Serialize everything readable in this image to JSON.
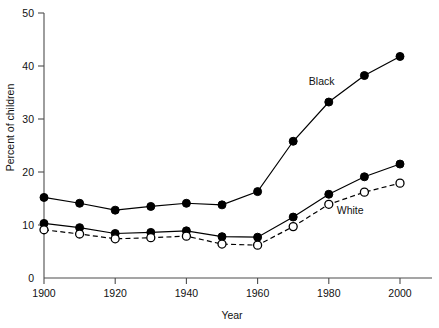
{
  "chart_data": {
    "type": "line",
    "title": "",
    "xlabel": "Year",
    "ylabel": "Percent of children",
    "xlim": [
      1895,
      2005
    ],
    "ylim": [
      0,
      50
    ],
    "xticks": [
      1900,
      1920,
      1940,
      1960,
      1980,
      2000
    ],
    "xtick_labels": [
      "1900",
      "1920",
      "1940",
      "1960",
      "1980",
      "2000"
    ],
    "yticks": [
      0,
      10,
      20,
      30,
      40,
      50
    ],
    "ytick_labels": [
      "0",
      "10",
      "20",
      "30",
      "40",
      "50"
    ],
    "grid": false,
    "legend": "inline-annotations",
    "x": [
      1900,
      1910,
      1920,
      1930,
      1940,
      1950,
      1960,
      1970,
      1980,
      1990,
      2000
    ],
    "series": [
      {
        "name": "Black",
        "label": "Black",
        "marker": "filled-circle",
        "linestyle": "solid",
        "color": "#000000",
        "values": [
          15.2,
          14.1,
          12.8,
          13.5,
          14.1,
          13.8,
          16.3,
          25.8,
          33.2,
          38.2,
          41.8
        ]
      },
      {
        "name": "Total",
        "label": "",
        "marker": "filled-circle",
        "linestyle": "solid",
        "color": "#000000",
        "values": [
          10.3,
          9.5,
          8.4,
          8.6,
          8.9,
          7.8,
          7.7,
          11.5,
          15.8,
          19.1,
          21.5
        ]
      },
      {
        "name": "White",
        "label": "White",
        "marker": "open-circle",
        "linestyle": "dashed",
        "color": "#000000",
        "values": [
          9.1,
          8.3,
          7.4,
          7.6,
          7.9,
          6.4,
          6.2,
          9.7,
          13.9,
          16.2,
          17.9
        ]
      }
    ],
    "annotations": [
      {
        "text": "Black",
        "x": 1978,
        "y": 36.5
      },
      {
        "text": "White",
        "x": 1986,
        "y": 12.0
      }
    ]
  },
  "axes": {
    "x_axis_name": "Year",
    "y_axis_name": "Percent of children"
  }
}
